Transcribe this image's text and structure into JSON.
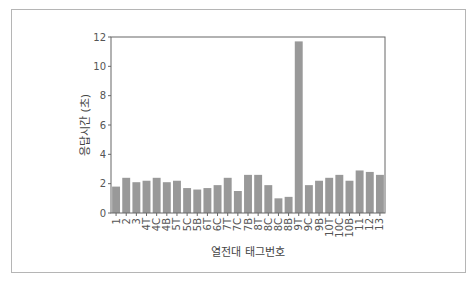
{
  "chart_data": {
    "type": "bar",
    "title": "",
    "xlabel": "열전대 태그번호",
    "ylabel": "응답시간 (초)",
    "ylim": [
      0,
      12
    ],
    "yticks": [
      0,
      2,
      4,
      6,
      8,
      10,
      12
    ],
    "grid": false,
    "bar_color": "#999999",
    "categories": [
      "1",
      "2",
      "3",
      "4T",
      "4C",
      "4B",
      "5T",
      "5C",
      "5B",
      "6T",
      "6C",
      "7T",
      "7C",
      "7B",
      "8T",
      "8C",
      "8C",
      "8B",
      "9T",
      "9C",
      "9B",
      "10T",
      "10C",
      "10B",
      "11",
      "12",
      "13"
    ],
    "values": [
      1.8,
      2.4,
      2.1,
      2.2,
      2.4,
      2.1,
      2.2,
      1.7,
      1.6,
      1.7,
      1.9,
      2.4,
      1.5,
      2.6,
      2.6,
      1.9,
      1.0,
      1.1,
      11.7,
      1.9,
      2.2,
      2.4,
      2.6,
      2.2,
      2.9,
      2.8,
      2.6
    ]
  }
}
